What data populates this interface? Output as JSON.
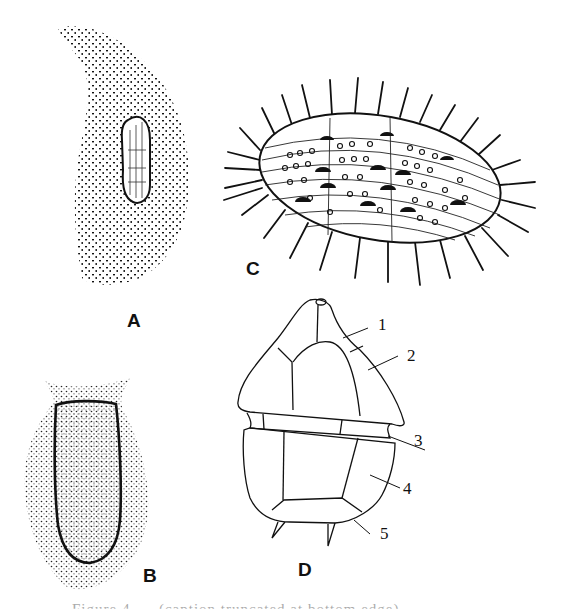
{
  "figure": {
    "panels": [
      {
        "id": "A",
        "label": "A",
        "description": "Stippled crescent-shaped cell with elongated oval nucleus"
      },
      {
        "id": "B",
        "label": "B",
        "description": "Stippled vase-shaped cell with flared collar and dark outlined inner body"
      },
      {
        "id": "C",
        "label": "C",
        "description": "Elongated ellipsoid cell covered in rows of pores and long radiating spines"
      },
      {
        "id": "D",
        "label": "D",
        "description": "Armoured theca line drawing with numbered plates"
      }
    ],
    "part_labels": [
      {
        "num": "1"
      },
      {
        "num": "2"
      },
      {
        "num": "3"
      },
      {
        "num": "4"
      },
      {
        "num": "5"
      }
    ],
    "caption": "Figure 4. ... (caption truncated at bottom edge)"
  },
  "colors": {
    "ink": "#111111",
    "background": "#ffffff"
  }
}
